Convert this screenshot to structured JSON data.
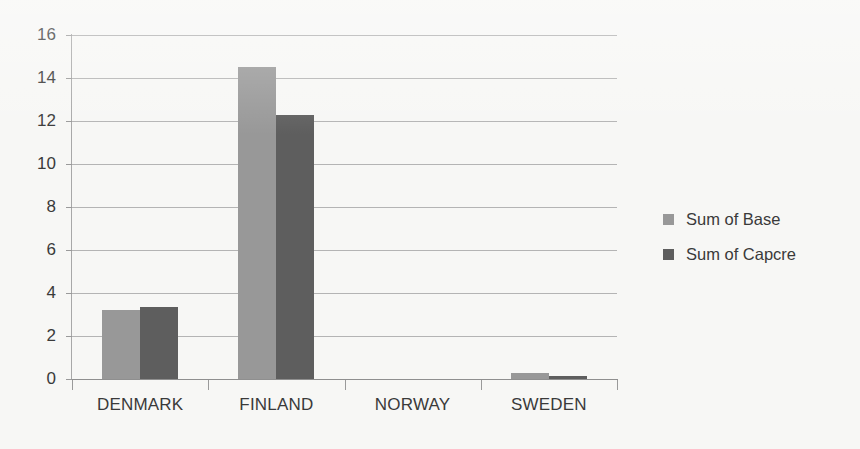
{
  "chart_data": {
    "type": "bar",
    "title": "",
    "subtitle": "",
    "xlabel": "",
    "ylabel": "",
    "categories": [
      "DENMARK",
      "FINLAND",
      "NORWAY",
      "SWEDEN"
    ],
    "series": [
      {
        "name": "Sum of Base",
        "color": "#989898",
        "values": [
          3.2,
          14.5,
          0,
          0.3
        ]
      },
      {
        "name": "Sum of Capcre",
        "color": "#5e5e5e",
        "values": [
          3.35,
          12.3,
          0,
          0.15
        ]
      }
    ],
    "ylim": [
      0,
      16
    ],
    "ytick_values": [
      0,
      2,
      4,
      6,
      8,
      10,
      12,
      14,
      16
    ],
    "ytick_labels": [
      "0",
      "2",
      "4",
      "6",
      "8",
      "10",
      "12",
      "14",
      "16"
    ],
    "grid": true,
    "grid_axis": "y",
    "legend_position": "right",
    "background_color": "#f7f7f5",
    "gridline_color": "#b4b4b4",
    "axis_color": "#8f8f8f",
    "text_color": "#3a3a3a"
  }
}
